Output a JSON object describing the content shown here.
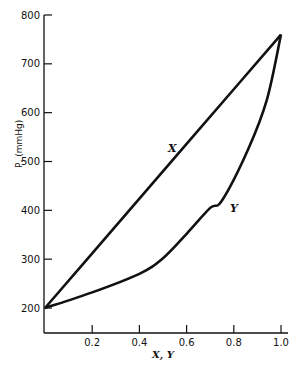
{
  "chart_data": {
    "type": "line",
    "title": "",
    "xlabel": "X, Y",
    "ylabel": "P, (mmHg)",
    "xlim": [
      0,
      1.0
    ],
    "ylim": [
      200,
      800
    ],
    "grid": false,
    "x_ticks": [
      "0.2",
      "0.4",
      "0.6",
      "0.8",
      "1.0"
    ],
    "y_ticks": [
      "200",
      "300",
      "400",
      "500",
      "600",
      "700",
      "800"
    ],
    "series": [
      {
        "name": "X",
        "x": [
          0.0,
          0.2,
          0.4,
          0.6,
          0.8,
          1.0
        ],
        "values": [
          200,
          312,
          424,
          536,
          648,
          760
        ]
      },
      {
        "name": "Y",
        "x": [
          0.0,
          0.2,
          0.4,
          0.5,
          0.6,
          0.7,
          0.75,
          0.86,
          0.94,
          1.0
        ],
        "values": [
          200,
          232,
          270,
          302,
          352,
          405,
          420,
          524,
          626,
          760
        ]
      }
    ],
    "annotations": [
      {
        "text": "X",
        "near_series": "X"
      },
      {
        "text": "Y",
        "near_series": "Y"
      }
    ]
  }
}
